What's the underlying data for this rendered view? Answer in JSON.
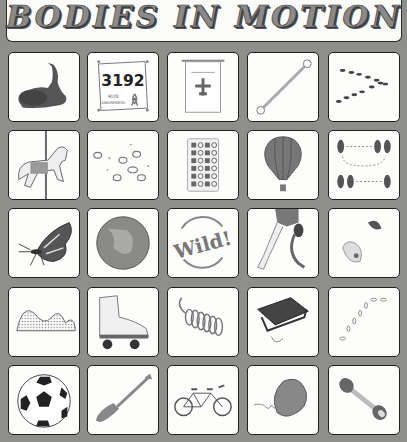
{
  "title": "BODIES IN MOTION",
  "colors": {
    "background": "#8e8e8c",
    "tile_fill": "#fdfdfc",
    "tile_border": "#1f1f1f"
  },
  "grid": {
    "rows": 5,
    "columns": 5,
    "tiles": [
      {
        "row": 1,
        "col": 1,
        "icon": "flamenco-dancer-icon",
        "label": "Flamenco dancer"
      },
      {
        "row": 1,
        "col": 2,
        "icon": "race-bib-icon",
        "label": "Race bib",
        "text": "3192",
        "subtext": "RUN FOR AWARENESS"
      },
      {
        "row": 1,
        "col": 3,
        "icon": "airplane-banner-icon",
        "label": "Airplane banner"
      },
      {
        "row": 1,
        "col": 4,
        "icon": "baton-icon",
        "label": "Baton"
      },
      {
        "row": 1,
        "col": 5,
        "icon": "marching-ants-icon",
        "label": "Marching ants"
      },
      {
        "row": 2,
        "col": 1,
        "icon": "carousel-horse-icon",
        "label": "Carousel horse"
      },
      {
        "row": 2,
        "col": 2,
        "icon": "hopping-rabbits-icon",
        "label": "Hopping rabbits"
      },
      {
        "row": 2,
        "col": 3,
        "icon": "pill-calendar-icon",
        "label": "Pill calendar"
      },
      {
        "row": 2,
        "col": 4,
        "icon": "hot-air-balloon-icon",
        "label": "Hot air balloon"
      },
      {
        "row": 2,
        "col": 5,
        "icon": "dance-steps-icon",
        "label": "Dance steps"
      },
      {
        "row": 3,
        "col": 1,
        "icon": "butterfly-icon",
        "label": "Monarch butterfly"
      },
      {
        "row": 3,
        "col": 2,
        "icon": "planet-icon",
        "label": "Planet"
      },
      {
        "row": 3,
        "col": 3,
        "icon": "wild-text-icon",
        "label": "Wild!",
        "text": "Wild!"
      },
      {
        "row": 3,
        "col": 4,
        "icon": "prosthetic-runner-icon",
        "label": "Prosthetic runner"
      },
      {
        "row": 3,
        "col": 5,
        "icon": "climbing-holds-icon",
        "label": "Climbing holds"
      },
      {
        "row": 4,
        "col": 1,
        "icon": "wave-icon",
        "label": "Wave"
      },
      {
        "row": 4,
        "col": 2,
        "icon": "roller-skate-icon",
        "label": "Roller skate"
      },
      {
        "row": 4,
        "col": 3,
        "icon": "slinky-icon",
        "label": "Slinky"
      },
      {
        "row": 4,
        "col": 4,
        "icon": "sled-icon",
        "label": "Sled"
      },
      {
        "row": 4,
        "col": 5,
        "icon": "footprints-icon",
        "label": "Footprints"
      },
      {
        "row": 5,
        "col": 1,
        "icon": "soccer-ball-icon",
        "label": "Soccer ball"
      },
      {
        "row": 5,
        "col": 2,
        "icon": "paddle-icon",
        "label": "Paddle"
      },
      {
        "row": 5,
        "col": 3,
        "icon": "tandem-bicycle-icon",
        "label": "Tandem bicycle"
      },
      {
        "row": 5,
        "col": 4,
        "icon": "tumbleweed-icon",
        "label": "Tumbleweed"
      },
      {
        "row": 5,
        "col": 5,
        "icon": "dumbbell-icon",
        "label": "Dumbbell"
      }
    ]
  }
}
